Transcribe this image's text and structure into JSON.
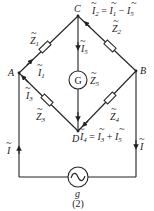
{
  "nodes": {
    "A": "A",
    "B": "B",
    "C": "C",
    "D": "D"
  },
  "impedances": {
    "Z1": {
      "letter": "Z",
      "sub": "1"
    },
    "Z2": {
      "letter": "Z",
      "sub": "2"
    },
    "Z3": {
      "letter": "Z",
      "sub": "3"
    },
    "Z4": {
      "letter": "Z",
      "sub": "4"
    },
    "Z5": {
      "letter": "Z",
      "sub": "5"
    }
  },
  "currents": {
    "I": {
      "letter": "I"
    },
    "I1": {
      "letter": "I",
      "sub": "1"
    },
    "I3": {
      "letter": "I",
      "sub": "3"
    },
    "I5": {
      "letter": "I",
      "sub": "5"
    }
  },
  "equations": {
    "eq_C": {
      "lhs": "I",
      "lhs_sub": "2",
      "eq": " = ",
      "t1": "I",
      "t1_sub": "1",
      "op": " − ",
      "t2": "I",
      "t2_sub": "5"
    },
    "eq_D": {
      "lhs": "I",
      "lhs_sub": "4",
      "eq": " = ",
      "t1": "I",
      "t1_sub": "3",
      "op": " + ",
      "t2": "I",
      "t2_sub": "5"
    }
  },
  "galvanometer": {
    "label": "G"
  },
  "source": {
    "label": "g",
    "symbol": "~"
  },
  "caption": "(2)",
  "colors": {
    "ink": "#222222",
    "background": "#ffffff"
  }
}
